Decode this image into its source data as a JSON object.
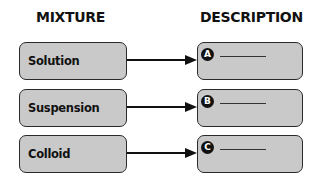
{
  "headings": {
    "left": "MIXTURE",
    "right": "DESCRIPTION"
  },
  "rows": [
    {
      "mixture": "Solution",
      "badge": "A",
      "description": ""
    },
    {
      "mixture": "Suspension",
      "badge": "B",
      "description": ""
    },
    {
      "mixture": "Colloid",
      "badge": "C",
      "description": ""
    }
  ],
  "colors": {
    "box_fill": "#c9c9c9",
    "box_border": "#2a2a2a",
    "badge_fill": "#111111"
  }
}
